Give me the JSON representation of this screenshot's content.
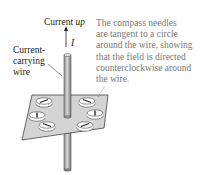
{
  "labels": {
    "current_prefix": "Current ",
    "current_dir": "up",
    "current_symbol": "I",
    "wire_label": "Current-\ncarrying\nwire"
  },
  "caption": "The compass needles\nare tangent to a circle\naround the wire, showing\nthat the field is directed\ncounterclockwise around\nthe wire.",
  "figure": {
    "compass_count": 6,
    "field_direction": "counterclockwise",
    "current_direction": "up"
  }
}
